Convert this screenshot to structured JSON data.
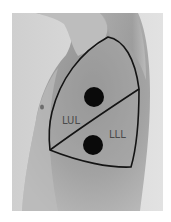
{
  "figure": {
    "labels": {
      "upper_lobe": "LUL",
      "lower_lobe": "LLL"
    },
    "markers": [
      {
        "name": "upper-lobe-point",
        "lobe": "LUL"
      },
      {
        "name": "lower-lobe-point",
        "lobe": "LLL"
      }
    ],
    "colors": {
      "outline": "#141414",
      "marker": "#0a0a0a",
      "background": "#d9d9d9",
      "skin": "#9e9e9e"
    }
  }
}
